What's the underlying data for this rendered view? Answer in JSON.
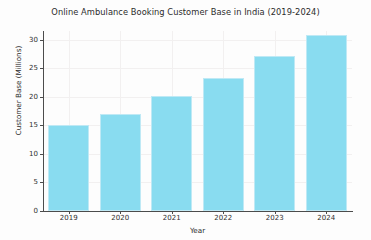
{
  "chart_data": {
    "type": "bar",
    "title": "Online Ambulance Booking Customer Base in India (2019-2024)",
    "xlabel": "Year",
    "ylabel": "Customer Base (Millions)",
    "categories": [
      "2019",
      "2020",
      "2021",
      "2022",
      "2023",
      "2024"
    ],
    "values": [
      15.0,
      16.9,
      20.1,
      23.2,
      27.2,
      30.8
    ],
    "series": [
      {
        "name": "Customer Base (Millions)",
        "values": [
          15.0,
          16.9,
          20.1,
          23.2,
          27.2,
          30.8
        ]
      }
    ],
    "ylim": [
      0,
      31.5
    ],
    "yticks": [
      0,
      5,
      10,
      15,
      20,
      25,
      30
    ],
    "ytick_labels": [
      "0",
      "5",
      "10",
      "15",
      "20",
      "25",
      "30"
    ],
    "xtick_labels": [
      "2019",
      "2020",
      "2021",
      "2022",
      "2023",
      "2024"
    ],
    "grid": true,
    "grid_axis": "both",
    "legend": false,
    "bar_color": "#89dcf0",
    "bar_edge_color": "#bfe9f5",
    "background_color": "#fdfdfd",
    "axis_color": "#4c4c4c",
    "grid_color": "#f2f0f0",
    "text_color": "#2c2c2c"
  }
}
